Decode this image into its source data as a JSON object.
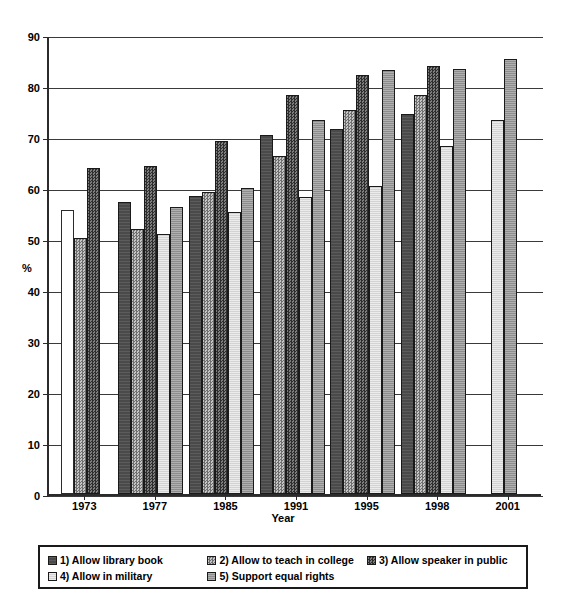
{
  "axis": {
    "y_title": "%",
    "x_title": "Year",
    "y_ticks": [
      "0",
      "10",
      "20",
      "30",
      "40",
      "50",
      "60",
      "70",
      "80",
      "90"
    ]
  },
  "legend": {
    "items": [
      {
        "label": "1) Allow library book",
        "key": "s1",
        "swatch": "dark-solid-swatch"
      },
      {
        "label": "2) Allow to teach in college",
        "key": "s2",
        "swatch": "medium-checker-swatch"
      },
      {
        "label": "3) Allow speaker in public",
        "key": "s3",
        "swatch": "dark-checker-swatch"
      },
      {
        "label": "4) Allow in military",
        "key": "s4",
        "swatch": "light-swatch"
      },
      {
        "label": "5) Support equal rights",
        "key": "s5",
        "swatch": "medium-gray-swatch"
      }
    ]
  },
  "chart_data": {
    "type": "bar",
    "title": "",
    "xlabel": "Year",
    "ylabel": "%",
    "ylim": [
      0,
      90
    ],
    "ytick_step": 10,
    "grid": true,
    "legend_position": "bottom",
    "categories": [
      "1973",
      "1977",
      "1985",
      "1991",
      "1995",
      "1998",
      "2001"
    ],
    "series": [
      {
        "name": "1) Allow library book",
        "key": "s1",
        "values": [
          55.7,
          57.3,
          58.5,
          70.3,
          71.5,
          74.5,
          null
        ]
      },
      {
        "name": "2) Allow to teach in college",
        "key": "s2",
        "values": [
          50.2,
          52.0,
          59.2,
          66.2,
          75.2,
          78.2,
          null
        ]
      },
      {
        "name": "3) Allow speaker in public",
        "key": "s3",
        "values": [
          64.0,
          64.3,
          69.2,
          78.2,
          82.2,
          84.0,
          null
        ]
      },
      {
        "name": "4) Allow in military",
        "key": "s4",
        "values": [
          null,
          51.0,
          55.2,
          58.3,
          60.3,
          68.3,
          73.4
        ]
      },
      {
        "name": "5) Support equal rights",
        "key": "s5",
        "values": [
          null,
          56.2,
          60.1,
          73.3,
          83.2,
          83.3,
          85.3
        ]
      }
    ]
  }
}
